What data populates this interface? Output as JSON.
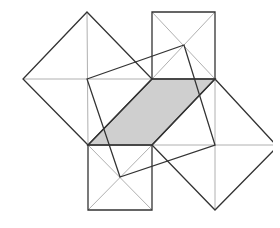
{
  "diagram": {
    "title": "",
    "colors": {
      "background": "#ffffff",
      "shade": "#cfcfcf",
      "stroke": "#333333",
      "thin": "#b0b0b0"
    },
    "shaded_parallelogram": [
      [
        88,
        145
      ],
      [
        152,
        145
      ],
      [
        215,
        79
      ],
      [
        152,
        79
      ]
    ],
    "top_square": [
      [
        152,
        12
      ],
      [
        215,
        12
      ],
      [
        215,
        79
      ],
      [
        152,
        79
      ]
    ],
    "bottom_square": [
      [
        88,
        145
      ],
      [
        152,
        145
      ],
      [
        152,
        210
      ],
      [
        88,
        210
      ]
    ],
    "left_diamond": [
      [
        87,
        12
      ],
      [
        152,
        79
      ],
      [
        88,
        145
      ],
      [
        23,
        79
      ]
    ],
    "right_diamond": [
      [
        215,
        79
      ],
      [
        276,
        145
      ],
      [
        215,
        210
      ],
      [
        152,
        145
      ]
    ],
    "inner_square": [
      [
        87,
        79
      ],
      [
        184,
        45
      ],
      [
        215,
        145
      ],
      [
        120,
        177
      ]
    ]
  }
}
